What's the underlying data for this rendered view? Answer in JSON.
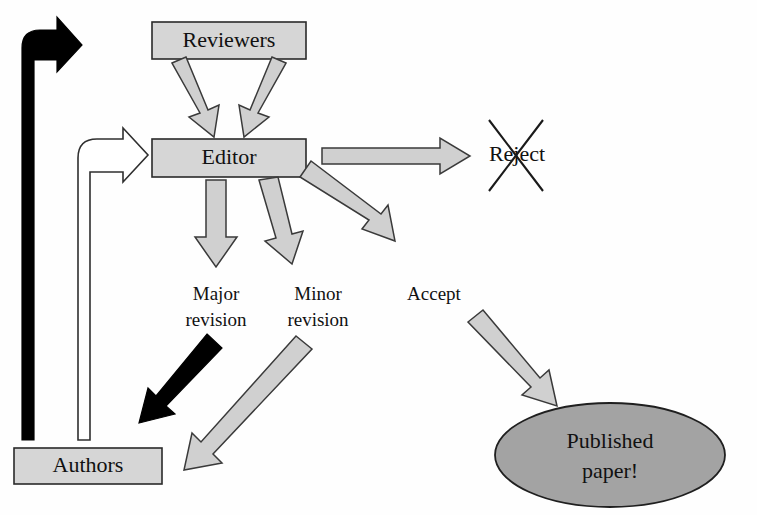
{
  "diagram": {
    "type": "flowchart",
    "background_color": "#fefefe"
  },
  "colors": {
    "box_fill": "#d6d6d6",
    "ellipse_fill": "#a3a3a3",
    "arrow_gray_fill": "#d0d0d0",
    "arrow_white_fill": "#ffffff",
    "arrow_black_fill": "#000000",
    "outline": "#2a2a2a",
    "text": "#111111"
  },
  "nodes": [
    {
      "id": "reviewers",
      "label": "Reviewers",
      "shape": "rectangle",
      "fill": "#d6d6d6"
    },
    {
      "id": "editor",
      "label": "Editor",
      "shape": "rectangle",
      "fill": "#d6d6d6"
    },
    {
      "id": "authors",
      "label": "Authors",
      "shape": "rectangle",
      "fill": "#d6d6d6"
    },
    {
      "id": "published",
      "label_line1": "Published",
      "label_line2": "paper!",
      "shape": "ellipse",
      "fill": "#a3a3a3"
    },
    {
      "id": "reject",
      "label": "Reject",
      "shape": "text",
      "crossed_out": true
    }
  ],
  "edge_labels": {
    "major_revision_line1": "Major",
    "major_revision_line2": "revision",
    "minor_revision_line1": "Minor",
    "minor_revision_line2": "revision",
    "accept": "Accept"
  },
  "edges": [
    {
      "id": "reviewers-to-editor-left",
      "from": "reviewers",
      "to": "editor",
      "style": "gray-block-arrow"
    },
    {
      "id": "reviewers-to-editor-right",
      "from": "reviewers",
      "to": "editor",
      "style": "gray-block-arrow"
    },
    {
      "id": "editor-to-reject",
      "from": "editor",
      "to": "reject",
      "style": "gray-block-arrow",
      "label": "Reject"
    },
    {
      "id": "editor-to-major",
      "from": "editor",
      "to": "major-revision",
      "style": "gray-block-arrow"
    },
    {
      "id": "editor-to-minor",
      "from": "editor",
      "to": "minor-revision",
      "style": "gray-block-arrow"
    },
    {
      "id": "editor-to-accept",
      "from": "editor",
      "to": "accept",
      "style": "gray-block-arrow"
    },
    {
      "id": "major-to-authors",
      "from": "major-revision",
      "to": "authors",
      "style": "black-arrow"
    },
    {
      "id": "minor-to-authors",
      "from": "minor-revision",
      "to": "authors",
      "style": "gray-block-arrow"
    },
    {
      "id": "accept-to-published",
      "from": "accept",
      "to": "published",
      "style": "gray-block-arrow"
    },
    {
      "id": "authors-to-reviewers",
      "from": "authors",
      "to": "reviewers",
      "style": "black-elbow-arrow"
    },
    {
      "id": "authors-to-editor",
      "from": "authors",
      "to": "editor",
      "style": "white-elbow-arrow"
    }
  ]
}
